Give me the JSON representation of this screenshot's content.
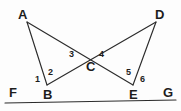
{
  "figure": {
    "background_color": "#fdfdfd",
    "line_color": "#2b2b2b",
    "label_color": "#1d1d1d",
    "vertices": [
      {
        "id": "A",
        "label": "A",
        "x": 27,
        "y": 22,
        "label_x": 18,
        "label_y": 8
      },
      {
        "id": "D",
        "label": "D",
        "x": 156,
        "y": 22,
        "label_x": 155,
        "label_y": 8
      },
      {
        "id": "B",
        "label": "B",
        "x": 47,
        "y": 85,
        "label_x": 43,
        "label_y": 88
      },
      {
        "id": "E",
        "label": "E",
        "x": 133,
        "y": 85,
        "label_x": 129,
        "label_y": 88
      },
      {
        "id": "C",
        "label": "C",
        "x": 90,
        "y": 57,
        "label_x": 86,
        "label_y": 60
      },
      {
        "id": "F",
        "label": "F",
        "x": 5,
        "y": 103,
        "label_x": 9,
        "label_y": 86
      },
      {
        "id": "G",
        "label": "G",
        "x": 176,
        "y": 100,
        "label_x": 163,
        "label_y": 86
      }
    ],
    "segments": [
      {
        "id": "FG",
        "name": "transversal-f-g",
        "from": "F",
        "to": "G"
      },
      {
        "id": "AB",
        "name": "segment-a-b",
        "from": "A",
        "to": "B"
      },
      {
        "id": "AE",
        "name": "segment-a-e",
        "from": "A",
        "to": "E"
      },
      {
        "id": "DE",
        "name": "segment-d-e",
        "from": "D",
        "to": "E"
      },
      {
        "id": "DB",
        "name": "segment-d-b",
        "from": "D",
        "to": "B"
      }
    ],
    "angles": [
      {
        "id": "1",
        "label": "1",
        "vertex": "B",
        "label_x": 35,
        "label_y": 75
      },
      {
        "id": "2",
        "label": "2",
        "vertex": "B",
        "label_x": 48,
        "label_y": 68
      },
      {
        "id": "3",
        "label": "3",
        "vertex": "C",
        "label_x": 69,
        "label_y": 50
      },
      {
        "id": "4",
        "label": "4",
        "vertex": "C",
        "label_x": 99,
        "label_y": 50
      },
      {
        "id": "5",
        "label": "5",
        "vertex": "E",
        "label_x": 126,
        "label_y": 68
      },
      {
        "id": "6",
        "label": "6",
        "vertex": "E",
        "label_x": 140,
        "label_y": 75
      }
    ]
  }
}
